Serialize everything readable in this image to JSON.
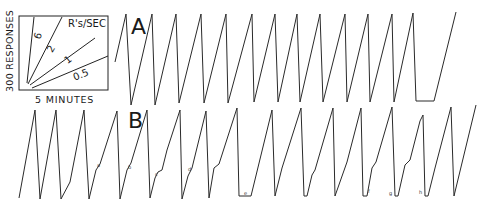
{
  "figure": {
    "legend": {
      "y_label": "300 RESPONSES",
      "x_label": "5 MINUTES",
      "rate_title": "R's/SEC",
      "rates": [
        "6",
        "2",
        "1",
        "0.5"
      ]
    },
    "panels": [
      {
        "letter": "A"
      },
      {
        "letter": "B"
      }
    ],
    "event_marks": [
      "a",
      "b",
      "c",
      "d",
      "e",
      "f",
      "g",
      "h"
    ]
  },
  "chart_data": {
    "type": "line",
    "xlabel": "5 MINUTES",
    "ylabel": "300 RESPONSES",
    "legend": {
      "title": "R's/SEC",
      "entries": [
        "6",
        "2",
        "1",
        "0.5"
      ]
    },
    "grid": false,
    "series": [
      {
        "name": "A",
        "points": [
          [
            115,
            62
          ],
          [
            126,
            14
          ],
          [
            131,
            105
          ],
          [
            152,
            14
          ],
          [
            155,
            105
          ],
          [
            176,
            14
          ],
          [
            179,
            103
          ],
          [
            201,
            14
          ],
          [
            204,
            103
          ],
          [
            226,
            14
          ],
          [
            228,
            103
          ],
          [
            252,
            14
          ],
          [
            254,
            102
          ],
          [
            275,
            14
          ],
          [
            278,
            102
          ],
          [
            297,
            14
          ],
          [
            300,
            102
          ],
          [
            320,
            14
          ],
          [
            323,
            102
          ],
          [
            345,
            14
          ],
          [
            347,
            102
          ],
          [
            368,
            14
          ],
          [
            370,
            102
          ],
          [
            392,
            14
          ],
          [
            394,
            102
          ],
          [
            413,
            13
          ],
          [
            416,
            101
          ],
          [
            434,
            101
          ],
          [
            456,
            12
          ]
        ]
      },
      {
        "name": "B",
        "points": [
          [
            19,
            198
          ],
          [
            35,
            110
          ],
          [
            40,
            199
          ],
          [
            56,
            110
          ],
          [
            61,
            199
          ],
          [
            70,
            182
          ],
          [
            84,
            110
          ],
          [
            89,
            199
          ],
          [
            96,
            170
          ],
          [
            100,
            164
          ],
          [
            117,
            111
          ],
          [
            120,
            199
          ],
          [
            127,
            170
          ],
          [
            131,
            163
          ],
          [
            147,
            110
          ],
          [
            150,
            198
          ],
          [
            155,
            178
          ],
          [
            158,
            172
          ],
          [
            162,
            170
          ],
          [
            167,
            150
          ],
          [
            180,
            110
          ],
          [
            182,
            199
          ],
          [
            188,
            176
          ],
          [
            192,
            168
          ],
          [
            206,
            111
          ],
          [
            209,
            198
          ],
          [
            214,
            168
          ],
          [
            219,
            164
          ],
          [
            237,
            108
          ],
          [
            239,
            196
          ],
          [
            251,
            196
          ],
          [
            272,
            110
          ],
          [
            275,
            196
          ],
          [
            282,
            168
          ],
          [
            301,
            108
          ],
          [
            304,
            196
          ],
          [
            307,
            196
          ],
          [
            312,
            175
          ],
          [
            315,
            170
          ],
          [
            333,
            108
          ],
          [
            335,
            196
          ],
          [
            347,
            162
          ],
          [
            361,
            108
          ],
          [
            363,
            196
          ],
          [
            367,
            196
          ],
          [
            372,
            168
          ],
          [
            376,
            162
          ],
          [
            392,
            107
          ],
          [
            395,
            196
          ],
          [
            398,
            196
          ],
          [
            405,
            165
          ],
          [
            410,
            160
          ],
          [
            420,
            121
          ],
          [
            423,
            115
          ],
          [
            425,
            196
          ],
          [
            428,
            196
          ],
          [
            435,
            168
          ],
          [
            451,
            107
          ],
          [
            454,
            196
          ],
          [
            476,
            105
          ]
        ]
      }
    ],
    "event_marks": [
      {
        "label": "a",
        "x": 97,
        "y": 162
      },
      {
        "label": "b",
        "x": 128,
        "y": 164
      },
      {
        "label": "c",
        "x": 155,
        "y": 171
      },
      {
        "label": "d",
        "x": 188,
        "y": 166
      },
      {
        "label": "e",
        "x": 244,
        "y": 190
      },
      {
        "label": "f",
        "x": 368,
        "y": 188
      },
      {
        "label": "g",
        "x": 389,
        "y": 190
      },
      {
        "label": "h",
        "x": 419,
        "y": 189
      }
    ]
  }
}
